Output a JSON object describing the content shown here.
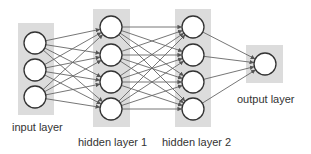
{
  "diagram": {
    "type": "neural-network",
    "colors": {
      "background": "#ffffff",
      "layer_box": "#dcdcdc",
      "node_fill": "#ffffff",
      "node_stroke": "#333333",
      "edge": "#666666",
      "text": "#333333"
    },
    "layers": [
      {
        "id": "input",
        "label": "input layer",
        "box": {
          "x": 18,
          "y": 23,
          "w": 36,
          "h": 92
        },
        "nodes": [
          {
            "cx": 35,
            "cy": 43
          },
          {
            "cx": 35,
            "cy": 70
          },
          {
            "cx": 35,
            "cy": 97
          }
        ],
        "label_pos": {
          "x": 12,
          "y": 131
        }
      },
      {
        "id": "hidden1",
        "label": "hidden layer 1",
        "box": {
          "x": 93,
          "y": 9,
          "w": 37,
          "h": 118
        },
        "nodes": [
          {
            "cx": 111,
            "cy": 27
          },
          {
            "cx": 111,
            "cy": 55
          },
          {
            "cx": 111,
            "cy": 82
          },
          {
            "cx": 111,
            "cy": 109
          }
        ],
        "label_pos": {
          "x": 78,
          "y": 146
        }
      },
      {
        "id": "hidden2",
        "label": "hidden layer 2",
        "box": {
          "x": 175,
          "y": 9,
          "w": 36,
          "h": 118
        },
        "nodes": [
          {
            "cx": 193,
            "cy": 27
          },
          {
            "cx": 193,
            "cy": 55
          },
          {
            "cx": 193,
            "cy": 82
          },
          {
            "cx": 193,
            "cy": 109
          }
        ],
        "label_pos": {
          "x": 162,
          "y": 146
        }
      },
      {
        "id": "output",
        "label": "output layer",
        "box": {
          "x": 246,
          "y": 45,
          "w": 37,
          "h": 38
        },
        "nodes": [
          {
            "cx": 265,
            "cy": 64
          }
        ],
        "label_pos": {
          "x": 237,
          "y": 103
        }
      }
    ],
    "node_radius": 11,
    "connections": "fully-connected between consecutive layers, arrowheads at target nodes"
  }
}
